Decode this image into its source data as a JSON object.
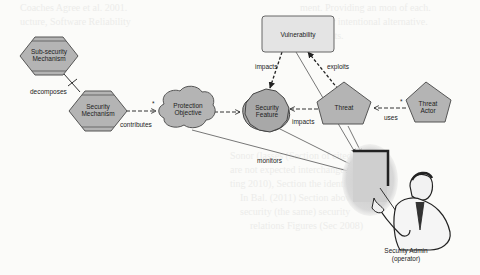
{
  "diagram": {
    "nodes": {
      "sub_security_mechanism": {
        "line1": "Sub-security",
        "line2": "Mechanism",
        "shape": "hexagon"
      },
      "security_mechanism": {
        "line1": "Security",
        "line2": "Mechanism",
        "shape": "hexagon"
      },
      "protection_objective": {
        "line1": "Protection",
        "line2": "Objective",
        "shape": "cloud"
      },
      "security_feature": {
        "line1": "Security",
        "line2": "Feature",
        "shape": "octagon-star"
      },
      "vulnerability": {
        "line1": "Vulnerability",
        "shape": "rounded-rectangle"
      },
      "threat": {
        "line1": "Threat",
        "shape": "pentagon"
      },
      "threat_actor": {
        "line1": "Threat",
        "line2": "Actor",
        "shape": "pentagon"
      },
      "security_admin": {
        "line1": "Security Admin",
        "line2": "(operator)",
        "shape": "person-clipart"
      }
    },
    "edges": {
      "decomposes": "decomposes",
      "contributes": "contributes",
      "impacts_vuln": "impacts",
      "exploits": "exploits",
      "impacts_threat": "impacts",
      "uses": "uses",
      "monitors": "monitors"
    },
    "colors": {
      "node_fill": "#b4b4b4",
      "node_stroke": "#555555",
      "vuln_fill": "#e4e4e4",
      "edge": "#333333"
    }
  },
  "background_text": [
    "ment. Providing an mon of each.",
    "Coaches Agree et al. 2001.",
    "ucture, Software Reliability",
    "ecture or intentional alternative.",
    "comments.",
    "Sonor (lasses (Section of cited",
    "are not expected interchangeable",
    "ting 2010), Section the identify",
    "In Bal. (2011) Section above and",
    "security (the same) security",
    "relations Figures (Sec 2008)"
  ]
}
